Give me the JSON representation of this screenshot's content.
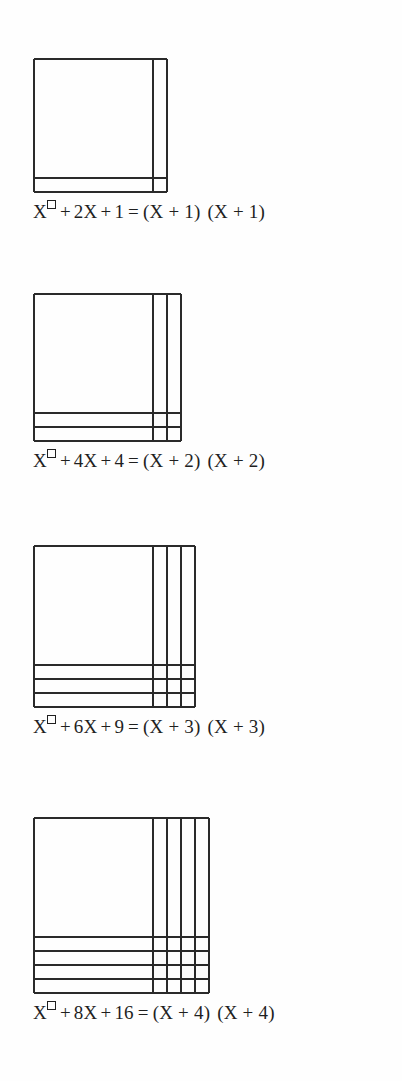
{
  "document": {
    "title": "Completing the Square — Geometric Identities",
    "background_color": "#fefefe",
    "ink_color": "#1f1f1f",
    "line_color": "#2a2a2a"
  },
  "chart_data": {
    "type": "diagram",
    "grid": "on",
    "legend": "none",
    "figures": [
      {
        "n": 1,
        "strips_right": 1,
        "strips_bottom": 1,
        "corner_units": 1,
        "x_square_area": "X^2",
        "linear_term": "2X",
        "constant_term": "1",
        "box_px": {
          "left": 33,
          "top": 65,
          "width": 139,
          "height": 138
        },
        "x_side_px": 119,
        "strip_px": 14
      },
      {
        "n": 2,
        "strips_right": 2,
        "strips_bottom": 2,
        "corner_units": 4,
        "x_square_area": "X^2",
        "linear_term": "4X",
        "constant_term": "4",
        "box_px": {
          "left": 33,
          "top": 300,
          "width": 153,
          "height": 152
        },
        "x_side_px": 119,
        "strip_px": 14
      },
      {
        "n": 3,
        "strips_right": 3,
        "strips_bottom": 3,
        "corner_units": 9,
        "x_square_area": "X^2",
        "linear_term": "6X",
        "constant_term": "9",
        "box_px": {
          "left": 33,
          "top": 552,
          "width": 167,
          "height": 166
        },
        "x_side_px": 119,
        "strip_px": 14
      },
      {
        "n": 4,
        "strips_right": 4,
        "strips_bottom": 4,
        "corner_units": 16,
        "x_square_area": "X^2",
        "linear_term": "8X",
        "constant_term": "16",
        "box_px": {
          "left": 33,
          "top": 824,
          "width": 181,
          "height": 180
        },
        "x_side_px": 119,
        "strip_px": 14
      }
    ]
  },
  "figures": [
    {
      "id": "figure-1",
      "caption": {
        "base": "X",
        "exponent_glyph": "square-box",
        "plus_1": "+",
        "linear": "2X",
        "plus_2": "+",
        "constant": "1",
        "equals": "=",
        "factor_1": "(X + 1)",
        "factor_2": "(X + 1)",
        "full_text": "X□+ 2X + 1 = (X + 1) (X + 1)"
      }
    },
    {
      "id": "figure-2",
      "caption": {
        "base": "X",
        "exponent_glyph": "square-box",
        "plus_1": "+",
        "linear": "4X",
        "plus_2": "+",
        "constant": "4",
        "equals": "=",
        "factor_1": "(X + 2)",
        "factor_2": "(X + 2)",
        "full_text": "X□+ 4X + 4 = (X + 2) (X + 2)"
      }
    },
    {
      "id": "figure-3",
      "caption": {
        "base": "X",
        "exponent_glyph": "square-box",
        "plus_1": "+",
        "linear": "6X",
        "plus_2": "+",
        "constant": "9",
        "equals": "=",
        "factor_1": "(X + 3)",
        "factor_2": "(X + 3)",
        "full_text": "X□+ 6X + 9 = (X + 3) (X + 3)"
      }
    },
    {
      "id": "figure-4",
      "caption": {
        "base": "X",
        "exponent_glyph": "square-box",
        "plus_1": "+",
        "linear": "8X",
        "plus_2": "+",
        "constant": "16",
        "equals": "=",
        "factor_1": "(X + 4)",
        "factor_2": "(X + 4)",
        "full_text": "X□+ 8X + 16 = (X + 4) (X + 4)"
      }
    }
  ]
}
